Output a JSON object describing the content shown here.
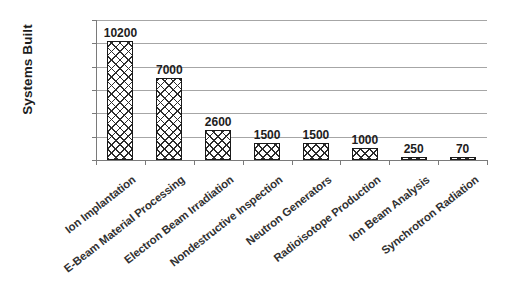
{
  "chart_data": {
    "type": "bar",
    "title": "",
    "xlabel": "",
    "ylabel": "Systems Built",
    "ylim": [
      0,
      12000
    ],
    "yticks": [
      0,
      2000,
      4000,
      6000,
      8000,
      10000,
      12000
    ],
    "ytick_labels": [
      "0",
      "2000",
      "4000",
      "6000",
      "8000",
      "10000",
      "12000"
    ],
    "grid": true,
    "legend": "none",
    "categories": [
      "Ion Implantation",
      "E-Beam Material Processing",
      "Electron Beam Irradiation",
      "Nondestructive Inspection",
      "Neutron Generators",
      "Radioisotope Production",
      "Ion Beam Analysis",
      "Synchrotron Radiation"
    ],
    "values": [
      10200,
      7000,
      2600,
      1500,
      1500,
      1000,
      250,
      70
    ],
    "value_labels": [
      "10200",
      "7000",
      "2600",
      "1500",
      "1500",
      "1000",
      "250",
      "70"
    ],
    "bar_style": {
      "fill": "cross-hatch",
      "fill_color": "#ffffff",
      "hatch_color": "#2b2b2b",
      "edge_color": "#1a1a1a"
    },
    "axis_color": "#7a7a7a",
    "gridline_color": "#a6a6a6",
    "text_color": "#1d1d1d",
    "background": "#ffffff"
  }
}
